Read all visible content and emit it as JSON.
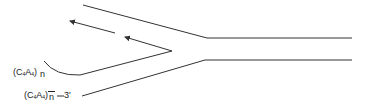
{
  "diagram": {
    "type": "dna-replication-fork",
    "stroke_color": "#333333",
    "labels": {
      "upper_repeat": {
        "base": "(C",
        "sub1": "4",
        "mid": "A",
        "sub2": "4",
        "close": ")",
        "count": "n"
      },
      "lower_repeat": {
        "base": "(C",
        "sub1": "4",
        "mid": "A",
        "sub2": "4",
        "close": ")",
        "count": "n",
        "end": "3'"
      }
    },
    "strands": [
      {
        "name": "parental-top-diagonal",
        "points": [
          [
            83,
            5
          ],
          [
            207,
            38
          ]
        ]
      },
      {
        "name": "parental-top-duplex",
        "points": [
          [
            207,
            38
          ],
          [
            352,
            38
          ]
        ]
      },
      {
        "name": "parental-bottom-duplex",
        "points": [
          [
            205,
            60
          ],
          [
            352,
            60
          ]
        ]
      },
      {
        "name": "parental-bottom-diagonal",
        "points": [
          [
            205,
            60
          ],
          [
            82,
            96
          ]
        ]
      },
      {
        "name": "extended-strand",
        "points": [
          [
            44,
            61
          ],
          [
            80,
            75
          ],
          [
            172,
            51
          ]
        ]
      }
    ],
    "arrows": [
      {
        "name": "okazaki-fragment-1",
        "from": [
          115,
          33
        ],
        "to": [
          70,
          21
        ]
      },
      {
        "name": "okazaki-fragment-2",
        "from": [
          172,
          51
        ],
        "to": [
          125,
          37
        ]
      }
    ]
  }
}
